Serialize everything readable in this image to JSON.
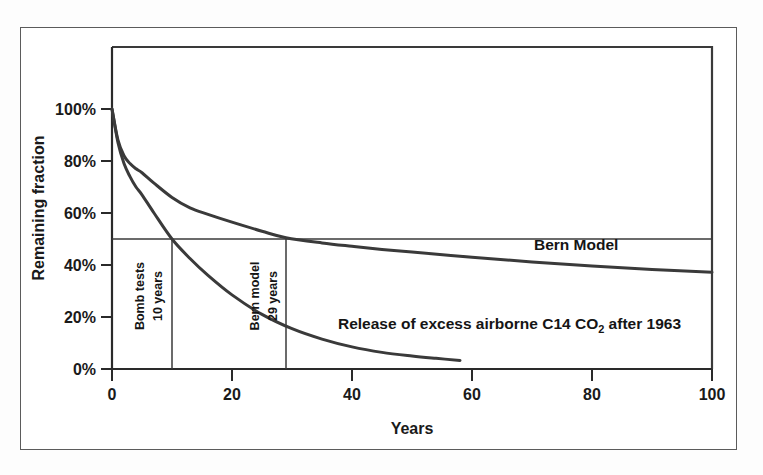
{
  "figure": {
    "border_color": "#5b5b5b",
    "background": "#ffffff",
    "line_color": "#3a3a3a",
    "axis_color": "#2a2a2a"
  },
  "chart_data": {
    "type": "line",
    "title": "",
    "xlabel": "Years",
    "ylabel": "Remaining fraction",
    "xlim": [
      0,
      100
    ],
    "ylim": [
      0,
      100
    ],
    "y_unit": "%",
    "grid": false,
    "legend_position": "inline-annotations",
    "xticks": [
      "0",
      "20",
      "40",
      "60",
      "80",
      "100"
    ],
    "xtick_values": [
      0,
      20,
      40,
      60,
      80,
      100
    ],
    "yticks": [
      "0%",
      "20%",
      "40%",
      "60%",
      "80%",
      "100%"
    ],
    "ytick_values": [
      0,
      20,
      40,
      60,
      80,
      100
    ],
    "series": [
      {
        "name": "Bern Model",
        "label": "Bern Model",
        "half_life_years": 29,
        "x": [
          0,
          1,
          2,
          3,
          4,
          5,
          7,
          10,
          13,
          16,
          20,
          25,
          29,
          35,
          40,
          45,
          50,
          60,
          70,
          80,
          90,
          100
        ],
        "values": [
          100,
          88,
          82,
          79,
          77,
          75.5,
          71.5,
          66,
          62,
          59.5,
          56.5,
          53,
          50.5,
          48.5,
          47.2,
          46,
          45,
          43,
          41.2,
          39.6,
          38.3,
          37.2
        ]
      },
      {
        "name": "Release of excess airborne C14 CO2 after 1963",
        "label": "Release of excess airborne C14 CO",
        "label_sub": "2",
        "label_tail": " after 1963",
        "half_life_years": 10,
        "x": [
          0,
          1,
          2,
          3,
          4,
          5,
          7,
          10,
          13,
          16,
          20,
          25,
          30,
          35,
          40,
          45,
          50,
          54,
          58
        ],
        "values": [
          100,
          87,
          79,
          74,
          70,
          67,
          60,
          50,
          42.5,
          36,
          28.5,
          21,
          15.5,
          11.5,
          8.5,
          6.4,
          5,
          4.1,
          3.3
        ]
      }
    ],
    "reference_lines": [
      {
        "name": "half-life-horizontal",
        "orientation": "horizontal",
        "value": 50,
        "from_x": 0,
        "to_x": 100
      },
      {
        "name": "bomb-tests-halflife-vertical",
        "orientation": "vertical",
        "value": 10,
        "from_y": 0,
        "to_y": 50
      },
      {
        "name": "bern-model-halflife-vertical",
        "orientation": "vertical",
        "value": 29,
        "from_y": 0,
        "to_y": 50
      }
    ],
    "annotations": [
      {
        "name": "bomb-tests-marker",
        "line1": "Bomb tests",
        "line2": "10 years",
        "rotation": -90,
        "at_x": 10,
        "at_y": 25
      },
      {
        "name": "bern-model-marker",
        "line1": "Bern model",
        "line2": "29 years",
        "rotation": -90,
        "at_x": 29,
        "at_y": 25
      },
      {
        "name": "bern-model-series-label",
        "text": "Bern Model",
        "at_x": 72,
        "at_y": 45
      },
      {
        "name": "c14-series-label",
        "text": "Release of excess airborne C14 CO2 after 1963",
        "at_x": 55,
        "at_y": 18
      }
    ]
  },
  "labels": {
    "y_axis_title": "Remaining fraction",
    "x_axis_title": "Years",
    "bern_model": "Bern Model",
    "release_part1": "Release of excess airborne C14 CO",
    "release_sub": "2",
    "release_part2": " after 1963",
    "bomb_tests_line1": "Bomb tests",
    "bomb_tests_line2": "10 years",
    "bern_marker_line1": "Bern model",
    "bern_marker_line2": "29 years",
    "ytick_100": "100%",
    "ytick_80": "80%",
    "ytick_60": "60%",
    "ytick_40": "40%",
    "ytick_20": "20%",
    "ytick_0": "0%",
    "xtick_0": "0",
    "xtick_20": "20",
    "xtick_40": "40",
    "xtick_60": "60",
    "xtick_80": "80",
    "xtick_100": "100"
  }
}
